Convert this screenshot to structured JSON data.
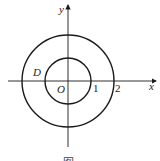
{
  "diagram": {
    "type": "concentric-circles-on-axes",
    "axes": {
      "x_label": "x",
      "y_label": "y",
      "origin_label": "O"
    },
    "ticks": {
      "tick_1": "1",
      "tick_2": "2"
    },
    "region_label": "D",
    "circles": [
      {
        "name": "inner",
        "radius": 1
      },
      {
        "name": "outer",
        "radius": 2
      }
    ],
    "caption": "图",
    "colors": {
      "stroke": "#1a1a1a",
      "background": "#ffffff"
    }
  }
}
